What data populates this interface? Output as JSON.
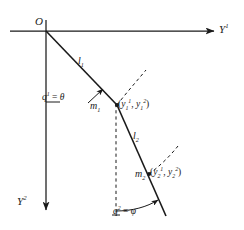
{
  "figure": {
    "background_color": "#ffffff",
    "stroke_color": "#1a1a1a"
  },
  "axes": {
    "origin_label": "O",
    "horizontal": {
      "name": "Y-superscript-1",
      "label_base": "Y",
      "label_sup": "1",
      "direction": "right"
    },
    "vertical": {
      "name": "Y-superscript-2",
      "label_base": "Y",
      "label_sup": "2",
      "direction": "down"
    }
  },
  "rods": [
    {
      "id": "l1",
      "label_base": "l",
      "label_sub": "1"
    },
    {
      "id": "l2",
      "label_base": "l",
      "label_sub": "2"
    }
  ],
  "masses": [
    {
      "id": "m1",
      "label_base": "m",
      "label_sub": "1",
      "coords_text": "(y₁¹ , y₁²)",
      "coord1_base": "y",
      "coord1_sub": "1",
      "coord1_sup": "1",
      "coord2_base": "y",
      "coord2_sub": "1",
      "coord2_sup": "2"
    },
    {
      "id": "m2",
      "label_base": "m",
      "label_sub": "2",
      "coords_text": "(y₂¹ , y₂²)",
      "coord1_base": "y",
      "coord1_sub": "2",
      "coord1_sup": "1",
      "coord2_base": "y",
      "coord2_sub": "2",
      "coord2_sup": "2"
    }
  ],
  "angles": [
    {
      "id": "q1",
      "q_base": "q",
      "q_sup": "1",
      "equals": "=",
      "symbol": "θ",
      "full_text": "q¹ = θ"
    },
    {
      "id": "q2",
      "q_base": "q",
      "q_sup": "2",
      "equals": "=",
      "symbol": "φ",
      "full_text": "q² = φ"
    }
  ]
}
